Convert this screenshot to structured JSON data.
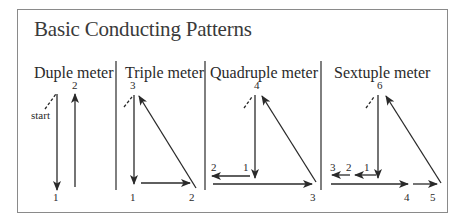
{
  "title": "Basic Conducting Patterns",
  "colors": {
    "frame": "#8a8a8a",
    "ink": "#2a2a2a"
  },
  "sections": [
    {
      "name": "duple",
      "heading": "Duple meter",
      "start_label": "start",
      "beats": [
        "1",
        "2"
      ]
    },
    {
      "name": "triple",
      "heading": "Triple meter",
      "beats": [
        "1",
        "2",
        "3"
      ]
    },
    {
      "name": "quadruple",
      "heading": "Quadruple meter",
      "beats": [
        "1",
        "2",
        "3",
        "4"
      ]
    },
    {
      "name": "sextuple",
      "heading": "Sextuple meter",
      "beats": [
        "1",
        "2",
        "3",
        "4",
        "5",
        "6"
      ]
    }
  ]
}
